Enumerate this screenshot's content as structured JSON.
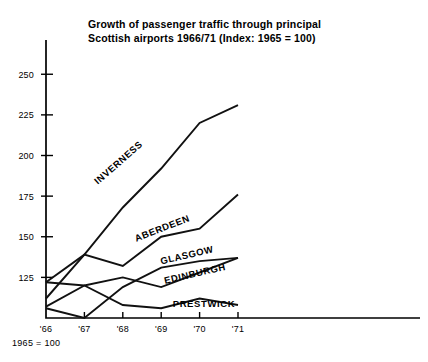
{
  "chart_data": {
    "type": "line",
    "title": "Growth of passenger traffic through principal\nScottish airports 1966/71 (Index: 1965 = 100)",
    "footnote": "1965 = 100",
    "xlabel": "",
    "ylabel": "",
    "categories": [
      "'66",
      "'67",
      "'68",
      "'69",
      "'70",
      "'71"
    ],
    "x_values": [
      1966,
      1967,
      1968,
      1969,
      1970,
      1971
    ],
    "ylim": [
      100,
      260
    ],
    "xlim": [
      1966,
      1971
    ],
    "y_ticks": [
      125,
      150,
      175,
      200,
      225,
      250
    ],
    "y_tick_labels": [
      "125",
      "150",
      "175",
      "200",
      "225",
      "250"
    ],
    "grid": false,
    "legend": "inline-labels",
    "series": [
      {
        "name": "INVERNESS",
        "values": [
          112,
          139,
          168,
          192,
          220,
          231
        ],
        "label_x": 1967.35,
        "label_y": 182,
        "label_rotate": -41
      },
      {
        "name": "ABERDEEN",
        "values": [
          122,
          139,
          132,
          150,
          155,
          176
        ],
        "label_x": 1968.35,
        "label_y": 147,
        "label_rotate": -21
      },
      {
        "name": "GLASGOW",
        "values": [
          106,
          100,
          119,
          131,
          135,
          137
        ],
        "label_x": 1969.0,
        "label_y": 133,
        "label_rotate": -13
      },
      {
        "name": "EDINBURGH",
        "values": [
          122,
          120,
          125,
          119,
          128,
          137
        ],
        "label_x": 1969.1,
        "label_y": 121,
        "label_rotate": -13
      },
      {
        "name": "PRESTWICK",
        "values": [
          107,
          120,
          108,
          106,
          112,
          108
        ],
        "label_x": 1969.3,
        "label_y": 107,
        "label_rotate": 0
      }
    ]
  }
}
